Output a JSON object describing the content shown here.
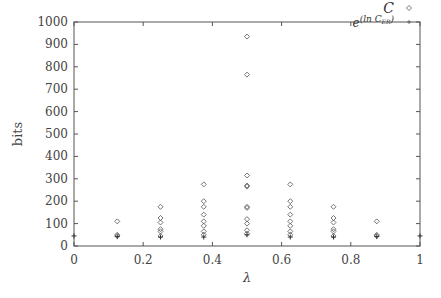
{
  "chart_data": {
    "type": "scatter",
    "title": "",
    "xlabel": "λ",
    "ylabel": "bits",
    "xlim": [
      0,
      1
    ],
    "ylim": [
      0,
      1000
    ],
    "grid": false,
    "legend_position": "top-right",
    "x_ticks": [
      "0",
      "0.2",
      "0.4",
      "0.6",
      "0.8",
      "1"
    ],
    "y_ticks": [
      "0",
      "100",
      "200",
      "300",
      "400",
      "500",
      "600",
      "700",
      "800",
      "900",
      "1000"
    ],
    "series": [
      {
        "name": "C",
        "marker": "diamond",
        "points": [
          [
            0.125,
            110
          ],
          [
            0.125,
            50
          ],
          [
            0.125,
            45
          ],
          [
            0.25,
            175
          ],
          [
            0.25,
            125
          ],
          [
            0.25,
            105
          ],
          [
            0.25,
            75
          ],
          [
            0.25,
            65
          ],
          [
            0.25,
            45
          ],
          [
            0.375,
            275
          ],
          [
            0.375,
            200
          ],
          [
            0.375,
            175
          ],
          [
            0.375,
            140
          ],
          [
            0.375,
            110
          ],
          [
            0.375,
            90
          ],
          [
            0.375,
            65
          ],
          [
            0.375,
            50
          ],
          [
            0.5,
            935
          ],
          [
            0.5,
            765
          ],
          [
            0.5,
            315
          ],
          [
            0.5,
            270
          ],
          [
            0.5,
            265
          ],
          [
            0.5,
            175
          ],
          [
            0.5,
            170
          ],
          [
            0.5,
            120
          ],
          [
            0.5,
            100
          ],
          [
            0.5,
            70
          ],
          [
            0.5,
            55
          ],
          [
            0.625,
            275
          ],
          [
            0.625,
            200
          ],
          [
            0.625,
            175
          ],
          [
            0.625,
            140
          ],
          [
            0.625,
            110
          ],
          [
            0.625,
            90
          ],
          [
            0.625,
            65
          ],
          [
            0.625,
            50
          ],
          [
            0.75,
            175
          ],
          [
            0.75,
            125
          ],
          [
            0.75,
            105
          ],
          [
            0.75,
            75
          ],
          [
            0.75,
            65
          ],
          [
            0.75,
            45
          ],
          [
            0.875,
            110
          ],
          [
            0.875,
            50
          ],
          [
            0.875,
            45
          ]
        ]
      },
      {
        "name": "e^(ln C_ER)",
        "marker": "plus",
        "points": [
          [
            0,
            45
          ],
          [
            0.125,
            42
          ],
          [
            0.25,
            40
          ],
          [
            0.375,
            40
          ],
          [
            0.5,
            50
          ],
          [
            0.625,
            40
          ],
          [
            0.75,
            40
          ],
          [
            0.875,
            42
          ],
          [
            1,
            45
          ]
        ]
      }
    ]
  },
  "legend": {
    "c_label": "C",
    "er_label_base": "e",
    "er_label_exp": "(ln C",
    "er_label_sub": "ER",
    "er_label_close": ")"
  }
}
